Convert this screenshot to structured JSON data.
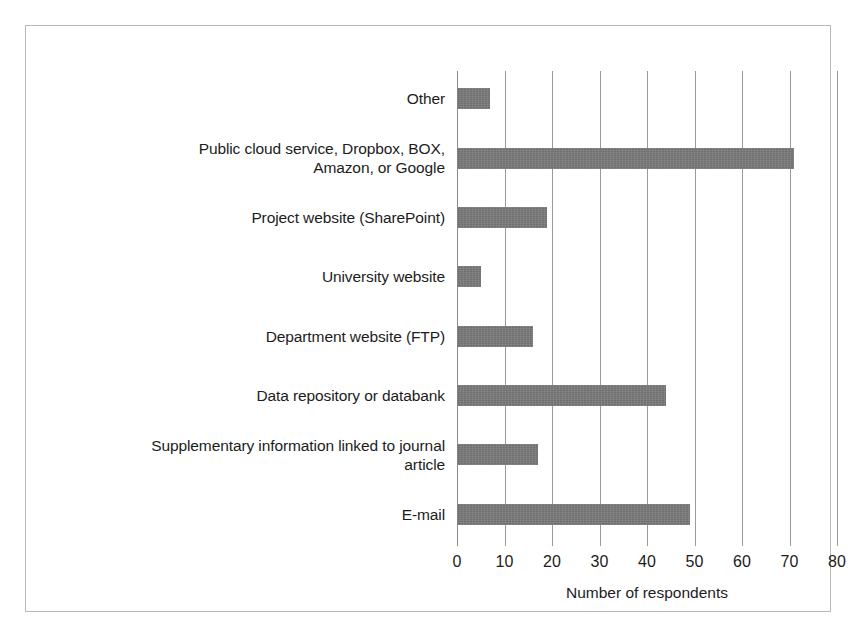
{
  "chart_data": {
    "type": "bar",
    "orientation": "horizontal",
    "title": "",
    "xlabel": "Number of respondents",
    "ylabel": "",
    "xlim": [
      0,
      80
    ],
    "xticks": [
      0,
      10,
      20,
      30,
      40,
      50,
      60,
      70,
      80
    ],
    "grid": "vertical",
    "legend": "none",
    "bar_color": "#7a7a7a",
    "categories": [
      "Other",
      "Public cloud service, Dropbox, BOX, Amazon, or Google",
      "Project website (SharePoint)",
      "University website",
      "Department website (FTP)",
      "Data repository or databank",
      "Supplementary information linked to journal article",
      "E-mail"
    ],
    "category_lines": [
      [
        "Other"
      ],
      [
        "Public cloud service, Dropbox, BOX,",
        "Amazon, or Google"
      ],
      [
        "Project website (SharePoint)"
      ],
      [
        "University website"
      ],
      [
        "Department website (FTP)"
      ],
      [
        "Data repository or databank"
      ],
      [
        "Supplementary information linked to journal",
        "article"
      ],
      [
        "E-mail"
      ]
    ],
    "values": [
      7,
      71,
      19,
      5,
      16,
      44,
      17,
      49
    ]
  }
}
